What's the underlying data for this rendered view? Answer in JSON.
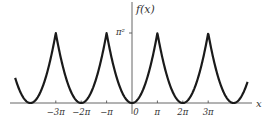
{
  "chart_data": {
    "type": "line",
    "title": "",
    "function": "f(x) = x^2 on [-π, π], extended periodically with period 2π",
    "xlabel": "x",
    "ylabel": "f(x)",
    "x_ticks": [
      {
        "label": "−3π",
        "value": -3
      },
      {
        "label": "−2π",
        "value": -2
      },
      {
        "label": "−π",
        "value": -1
      },
      {
        "label": "0",
        "value": 0
      },
      {
        "label": "π",
        "value": 1
      },
      {
        "label": "2π",
        "value": 2
      },
      {
        "label": "3π",
        "value": 3
      }
    ],
    "y_ticks": [
      {
        "label": "π²",
        "value": 1
      }
    ],
    "x_units": "multiples of π",
    "y_units": "multiples of π²",
    "xlim": [
      -4.6,
      4.55
    ],
    "ylim": [
      0,
      1.25
    ],
    "peaks": [
      {
        "x": -3,
        "y": 1
      },
      {
        "x": -1,
        "y": 1
      },
      {
        "x": 1,
        "y": 1
      },
      {
        "x": 3,
        "y": 1
      }
    ],
    "minima": [
      {
        "x": -4,
        "y": 0
      },
      {
        "x": -2,
        "y": 0
      },
      {
        "x": 0,
        "y": 0
      },
      {
        "x": 2,
        "y": 0
      },
      {
        "x": 4,
        "y": 0
      }
    ],
    "period": 2,
    "grid": false,
    "legend": null
  },
  "labels": {
    "y_axis": "f(x)",
    "x_axis": "x",
    "y_tick": "π²"
  }
}
